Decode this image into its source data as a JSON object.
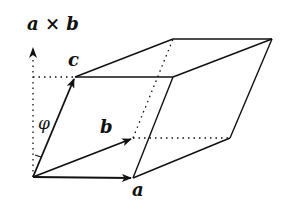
{
  "diagram": {
    "labels": {
      "cross": "a × b",
      "a": "a",
      "b": "b",
      "c": "c",
      "angle": "φ"
    },
    "colors": {
      "stroke": "#111111",
      "background": "#ffffff"
    },
    "vertices": {
      "O": [
        33,
        177
      ],
      "A": [
        133,
        178
      ],
      "B": [
        133,
        138
      ],
      "AB": [
        230,
        138
      ],
      "C": [
        75,
        77
      ],
      "AC": [
        173,
        77
      ],
      "BC": [
        173,
        39
      ],
      "ABC": [
        272,
        39
      ]
    }
  }
}
